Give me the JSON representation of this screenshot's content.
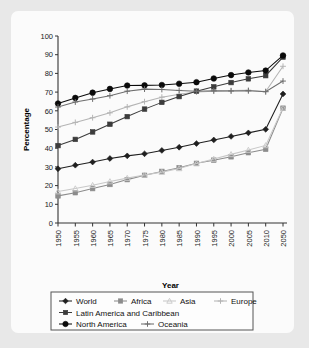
{
  "chart_data": {
    "type": "line",
    "title": "",
    "xlabel": "Year",
    "ylabel": "Percentage",
    "ylim": [
      0,
      100
    ],
    "ytick_step": 10,
    "grid": false,
    "legend_position": "bottom",
    "categories": [
      "1950",
      "1955",
      "1960",
      "1965",
      "1970",
      "1975",
      "1980",
      "1985",
      "1990",
      "1995",
      "2000",
      "2005",
      "2010",
      "2050"
    ],
    "yticks": [
      "0",
      "10",
      "20",
      "30",
      "40",
      "50",
      "60",
      "70",
      "80",
      "90",
      "100"
    ],
    "series": [
      {
        "name": "World",
        "marker": "diamond",
        "color": "#1f1f1f",
        "values": [
          29.0,
          30.9,
          32.6,
          34.5,
          35.9,
          37.0,
          38.8,
          40.5,
          42.5,
          44.4,
          46.3,
          48.2,
          50.1,
          69.0
        ]
      },
      {
        "name": "Africa",
        "marker": "square",
        "color": "#8c8c8c",
        "values": [
          14.5,
          16.2,
          18.4,
          20.6,
          23.2,
          25.5,
          27.6,
          29.6,
          31.9,
          33.6,
          35.4,
          37.6,
          39.4,
          61.4
        ]
      },
      {
        "name": "Asia",
        "marker": "triangle",
        "color": "#c8c8c8",
        "values": [
          16.8,
          18.4,
          20.2,
          22.2,
          24.0,
          25.7,
          27.2,
          29.2,
          31.8,
          34.2,
          36.7,
          39.0,
          41.5,
          61.6
        ]
      },
      {
        "name": "Europe",
        "marker": "plus",
        "color": "#b4b4b4",
        "values": [
          51.3,
          53.8,
          56.3,
          58.9,
          62.1,
          64.9,
          67.3,
          68.9,
          70.0,
          70.5,
          70.8,
          71.0,
          70.3,
          83.8
        ]
      },
      {
        "name": "Latin America and Caribbean",
        "marker": "square",
        "color": "#3c3c3c",
        "values": [
          41.4,
          44.7,
          48.7,
          52.8,
          56.9,
          60.9,
          64.5,
          67.6,
          70.5,
          72.8,
          75.1,
          77.1,
          78.8,
          88.7
        ]
      },
      {
        "name": "North America",
        "marker": "circle",
        "color": "#0a0a0a",
        "values": [
          63.9,
          66.9,
          69.7,
          71.7,
          73.5,
          73.6,
          73.8,
          74.5,
          75.3,
          77.3,
          79.1,
          80.5,
          81.5,
          89.6
        ]
      },
      {
        "name": "Oceania",
        "marker": "plus",
        "color": "#6e6e6e",
        "values": [
          62.0,
          64.7,
          66.3,
          68.1,
          70.5,
          71.6,
          71.4,
          70.9,
          70.5,
          70.7,
          70.6,
          70.7,
          70.2,
          75.9
        ]
      }
    ],
    "legend": [
      {
        "label": "World",
        "marker": "diamond",
        "color": "#1f1f1f"
      },
      {
        "label": "Africa",
        "marker": "square",
        "color": "#8c8c8c"
      },
      {
        "label": "Asia",
        "marker": "triangle",
        "color": "#c8c8c8"
      },
      {
        "label": "Europe",
        "marker": "plus",
        "color": "#b4b4b4"
      },
      {
        "label": "Latin America and Caribbean",
        "marker": "square",
        "color": "#3c3c3c"
      },
      {
        "label": "North America",
        "marker": "circle",
        "color": "#0a0a0a"
      },
      {
        "label": "Oceania",
        "marker": "plus",
        "color": "#6e6e6e"
      }
    ]
  },
  "colors": {
    "page_background": "#e8e8e8",
    "panel_background": "#fbfbfb",
    "axis": "#333333",
    "legend_border": "#555555",
    "text": "#111111"
  }
}
